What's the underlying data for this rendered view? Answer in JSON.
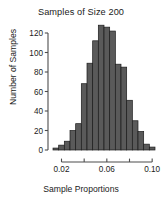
{
  "chart_data": {
    "type": "bar",
    "title": "Samples of Size 200",
    "xlabel": "Sample Proportions",
    "ylabel": "Number of Samples",
    "grid": false,
    "legend": null,
    "xlim": [
      0.0125,
      0.1025
    ],
    "ylim": [
      0,
      128
    ],
    "bin_width": 0.005,
    "x_tick_labels": [
      "0.02",
      "0.06",
      "0.10"
    ],
    "x_tick_values": [
      0.02,
      0.06,
      0.1
    ],
    "x_minor_tick_values": [
      0.04,
      0.08
    ],
    "y_tick_labels": [
      "0",
      "20",
      "40",
      "60",
      "80",
      "100",
      "120"
    ],
    "y_tick_values": [
      0,
      20,
      40,
      60,
      80,
      100,
      120
    ],
    "categories": [
      "0.0125",
      "0.0175",
      "0.0225",
      "0.0275",
      "0.0325",
      "0.0375",
      "0.0425",
      "0.0475",
      "0.0525",
      "0.0575",
      "0.0625",
      "0.0675",
      "0.0725",
      "0.0775",
      "0.0825",
      "0.0875",
      "0.0925",
      "0.0975"
    ],
    "bin_centers": [
      0.015,
      0.02,
      0.025,
      0.03,
      0.035,
      0.04,
      0.045,
      0.05,
      0.055,
      0.06,
      0.065,
      0.07,
      0.075,
      0.08,
      0.085,
      0.09,
      0.095,
      0.1
    ],
    "values": [
      2,
      5,
      9,
      20,
      27,
      68,
      89,
      112,
      128,
      126,
      122,
      88,
      85,
      51,
      30,
      19,
      6,
      3
    ],
    "bar_fill_color": "#5a5a5a",
    "bar_edge_color": "#1c1c1c",
    "axis_color": "#4d4d4d"
  }
}
